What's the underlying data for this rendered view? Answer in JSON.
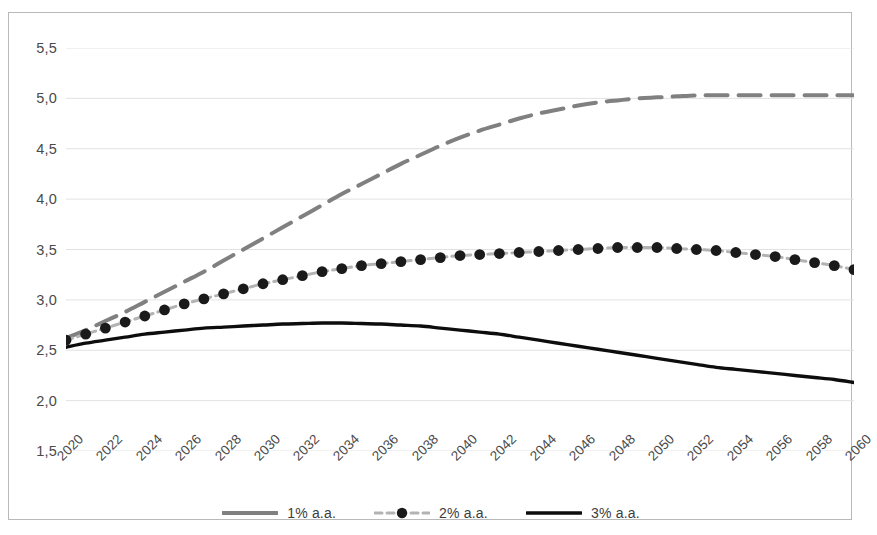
{
  "chart_data": {
    "type": "line",
    "title": "",
    "subtitle": "",
    "xlabel": "",
    "ylabel": "",
    "xlim": [
      2020,
      2060
    ],
    "ylim": [
      1.5,
      5.5
    ],
    "ytick_step": 0.5,
    "grid": true,
    "grid_axis": "y",
    "legend_position": "bottom",
    "decimal_separator": ",",
    "x": [
      2020,
      2021,
      2022,
      2023,
      2024,
      2025,
      2026,
      2027,
      2028,
      2029,
      2030,
      2031,
      2032,
      2033,
      2034,
      2035,
      2036,
      2037,
      2038,
      2039,
      2040,
      2041,
      2042,
      2043,
      2044,
      2045,
      2046,
      2047,
      2048,
      2049,
      2050,
      2051,
      2052,
      2053,
      2054,
      2055,
      2056,
      2057,
      2058,
      2059,
      2060
    ],
    "xticks": [
      "2020",
      "2022",
      "2024",
      "2026",
      "2028",
      "2030",
      "2032",
      "2034",
      "2036",
      "2038",
      "2040",
      "2042",
      "2044",
      "2046",
      "2048",
      "2050",
      "2052",
      "2054",
      "2056",
      "2058",
      "2060"
    ],
    "yticks": [
      "1,5",
      "2,0",
      "2,5",
      "3,0",
      "3,5",
      "4,0",
      "4,5",
      "5,0",
      "5,5"
    ],
    "ytick_values": [
      1.5,
      2.0,
      2.5,
      3.0,
      3.5,
      4.0,
      4.5,
      5.0,
      5.5
    ],
    "series": [
      {
        "name": "1% a.a.",
        "color": "#808080",
        "style": "dashed",
        "marker": "none",
        "width": 4.0,
        "values": [
          2.62,
          2.7,
          2.79,
          2.88,
          2.98,
          3.08,
          3.18,
          3.28,
          3.39,
          3.5,
          3.61,
          3.72,
          3.83,
          3.94,
          4.05,
          4.15,
          4.25,
          4.35,
          4.44,
          4.53,
          4.61,
          4.68,
          4.74,
          4.8,
          4.85,
          4.89,
          4.93,
          4.96,
          4.98,
          5.0,
          5.01,
          5.02,
          5.03,
          5.03,
          5.03,
          5.03,
          5.03,
          5.03,
          5.03,
          5.03,
          5.03
        ]
      },
      {
        "name": "2% a.a.",
        "color": "#b3b3b3",
        "marker_color": "#1a1a1a",
        "style": "dashed",
        "marker": "circle",
        "width": 3.0,
        "values": [
          2.6,
          2.66,
          2.72,
          2.78,
          2.84,
          2.9,
          2.96,
          3.01,
          3.06,
          3.11,
          3.16,
          3.2,
          3.24,
          3.28,
          3.31,
          3.34,
          3.36,
          3.38,
          3.4,
          3.42,
          3.44,
          3.45,
          3.46,
          3.47,
          3.48,
          3.49,
          3.5,
          3.51,
          3.52,
          3.52,
          3.52,
          3.51,
          3.5,
          3.49,
          3.47,
          3.45,
          3.43,
          3.4,
          3.37,
          3.34,
          3.3
        ]
      },
      {
        "name": "3% a.a.",
        "color": "#0d0d0d",
        "style": "solid",
        "marker": "none",
        "width": 3.4,
        "values": [
          2.53,
          2.57,
          2.6,
          2.63,
          2.66,
          2.68,
          2.7,
          2.72,
          2.73,
          2.74,
          2.75,
          2.76,
          2.765,
          2.77,
          2.77,
          2.765,
          2.76,
          2.75,
          2.74,
          2.72,
          2.7,
          2.68,
          2.66,
          2.63,
          2.6,
          2.57,
          2.54,
          2.51,
          2.48,
          2.45,
          2.42,
          2.39,
          2.36,
          2.33,
          2.31,
          2.29,
          2.27,
          2.25,
          2.23,
          2.21,
          2.18
        ]
      }
    ]
  },
  "legend": {
    "items": [
      {
        "label": "1% a.a."
      },
      {
        "label": "2% a.a."
      },
      {
        "label": "3% a.a."
      }
    ]
  },
  "colors": {
    "series_1": "#808080",
    "series_2": "#b3b3b3",
    "series_2_marker": "#1a1a1a",
    "series_3": "#0d0d0d",
    "gridline": "#e2e2e2",
    "frame": "#b9b9b9",
    "tick_text": "#4a4a4a"
  }
}
